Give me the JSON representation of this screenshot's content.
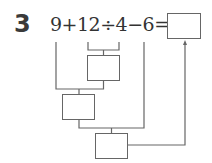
{
  "problem": {
    "number": "3",
    "expression": "9+12÷4−6=",
    "answer_box": ""
  },
  "diagram": {
    "step_boxes": [
      {
        "id": "step1",
        "represents": "12÷4",
        "value": ""
      },
      {
        "id": "step2",
        "represents": "9+(12÷4)",
        "value": ""
      },
      {
        "id": "step3",
        "represents": "(9+12÷4)−6",
        "value": ""
      }
    ],
    "line_color": "#666666"
  }
}
